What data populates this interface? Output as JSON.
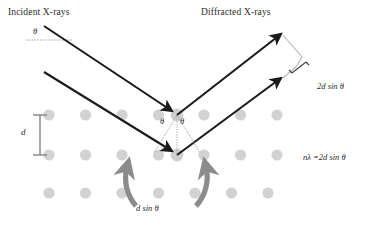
{
  "figure": {
    "width": 373,
    "height": 242,
    "background": "#ffffff"
  },
  "labels": {
    "incident_xrays": "Incident X-rays",
    "diffracted_xrays": "Diffracted X-rays",
    "theta_incident": "θ",
    "theta_left": "θ",
    "theta_right": "θ",
    "d_spacing": "d",
    "path_difference_total": "2d sin θ",
    "bragg_equation": "nλ =2d sin θ",
    "path_difference_half": "d sin θ",
    "caption": ""
  },
  "colors": {
    "ray": "#1a1a1a",
    "atom": "#d2d2d2",
    "atom_highlight": "#c0c0c0",
    "curved_arrow": "#8c8c8c",
    "bracket": "#8a8a8a",
    "dotted_guide": "#9a9a9a",
    "text": "#2b2b2b",
    "background": "#ffffff"
  },
  "lattice": {
    "description": "crystal atom lattice",
    "columns": 8,
    "rows": 3,
    "x_start": 49,
    "x_step": 36.5,
    "row_y": [
      115,
      155,
      193
    ],
    "radius": 5.6,
    "atom_name": "lattice-atom"
  },
  "rays": {
    "incident": [
      {
        "name": "incident-ray-upper",
        "x1": 44,
        "y1": 26,
        "x2": 177,
        "y2": 115
      },
      {
        "name": "incident-ray-lower",
        "x1": 44,
        "y1": 72,
        "x2": 177,
        "y2": 155
      }
    ],
    "diffracted": [
      {
        "name": "diffracted-ray-upper",
        "x1": 177,
        "y1": 115,
        "x2": 282,
        "y2": 34
      },
      {
        "name": "diffracted-ray-lower",
        "x1": 177,
        "y1": 155,
        "x2": 282,
        "y2": 78
      }
    ]
  },
  "scattering_points": [
    {
      "name": "scattering-point-upper",
      "x": 177,
      "y": 115
    },
    {
      "name": "scattering-point-lower",
      "x": 177,
      "y": 155
    }
  ],
  "angle_guides": {
    "vertical_dotted": {
      "x": 177,
      "y1": 115,
      "y2": 155
    },
    "arc_radius": 30
  },
  "curved_arrows": [
    {
      "name": "curved-arrow-left",
      "direction": "counterclockwise"
    },
    {
      "name": "curved-arrow-right",
      "direction": "clockwise"
    }
  ],
  "d_bracket": {
    "x": 40,
    "y_top": 115,
    "y_bottom": 155,
    "cap_half_width": 7
  }
}
